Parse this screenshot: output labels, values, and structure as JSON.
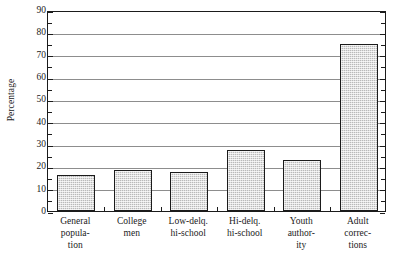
{
  "chart_data": {
    "type": "bar",
    "title": "",
    "xlabel": "",
    "ylabel": "Percentage",
    "ylim": [
      0,
      90
    ],
    "ytick_step": 10,
    "yminor_step": 5,
    "grid": "horizontal",
    "legend": "none",
    "categories": [
      "General population",
      "College men",
      "Low-delq. hi-school",
      "Hi-delq. hi-school",
      "Youth authority",
      "Adult corrections"
    ],
    "category_lines": [
      [
        "General",
        "popula-",
        "tion"
      ],
      [
        "College",
        "men"
      ],
      [
        "Low-delq.",
        "hi-school"
      ],
      [
        "Hi-delq.",
        "hi-school"
      ],
      [
        "Youth",
        "author-",
        "ity"
      ],
      [
        "Adult",
        "correc-",
        "tions"
      ]
    ],
    "values": [
      16,
      18.5,
      17.5,
      27.5,
      23,
      75
    ],
    "ytick_labels": [
      "0",
      "10",
      "20",
      "30",
      "40",
      "50",
      "60",
      "70",
      "80",
      "90"
    ],
    "bar_fill": "#b9b9b9",
    "bar_edge": "#1b1b1b",
    "gridline_color": "#8d8d8d",
    "axis_color": "#1b1b1b",
    "background": "#ffffff"
  }
}
